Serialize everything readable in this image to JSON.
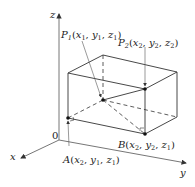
{
  "diagram": {
    "axes": {
      "x_label": "x",
      "y_label": "y",
      "z_label": "z",
      "origin_label": "0"
    },
    "points": {
      "P1": {
        "name": "P",
        "sub": "1",
        "coords": [
          "x",
          "1",
          "y",
          "1",
          "z",
          "1"
        ]
      },
      "P2": {
        "name": "P",
        "sub": "2",
        "coords": [
          "x",
          "2",
          "y",
          "2",
          "z",
          "2"
        ]
      },
      "A": {
        "name": "A",
        "coords": [
          "x",
          "2",
          "y",
          "1",
          "z",
          "1"
        ]
      },
      "B": {
        "name": "B",
        "coords": [
          "x",
          "2",
          "y",
          "2",
          "z",
          "1"
        ]
      }
    },
    "colors": {
      "line": "#333333",
      "axis": "#555555",
      "point": "#111111"
    }
  }
}
